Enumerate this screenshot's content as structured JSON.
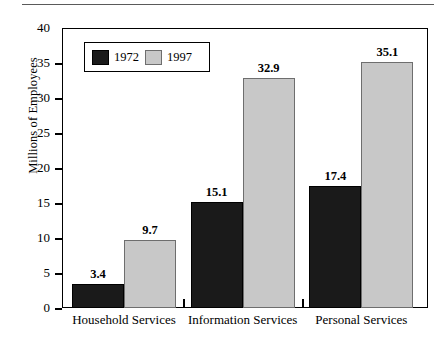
{
  "page": {
    "top_rule": "horizontal-rule"
  },
  "chart_data": {
    "type": "bar",
    "title": "",
    "xlabel": "",
    "ylabel": "Millions of Employees",
    "ylim": [
      0,
      40
    ],
    "yticks": [
      0,
      5,
      10,
      15,
      20,
      25,
      30,
      35,
      40
    ],
    "ytick_labels": [
      "0",
      "5",
      "10",
      "15",
      "20",
      "25",
      "30",
      "35",
      "40"
    ],
    "grid": false,
    "legend_position": "upper-left-inside",
    "categories": [
      "Household Services",
      "Information Services",
      "Personal Services"
    ],
    "series": [
      {
        "name": "1972",
        "color": "#1a1a1a",
        "values": [
          3.4,
          15.1,
          17.4
        ],
        "value_labels": [
          "3.4",
          "15.1",
          "17.4"
        ]
      },
      {
        "name": "1997",
        "color": "#c8c8c8",
        "values": [
          9.7,
          32.9,
          35.1
        ],
        "value_labels": [
          "9.7",
          "32.9",
          "35.1"
        ]
      }
    ]
  }
}
